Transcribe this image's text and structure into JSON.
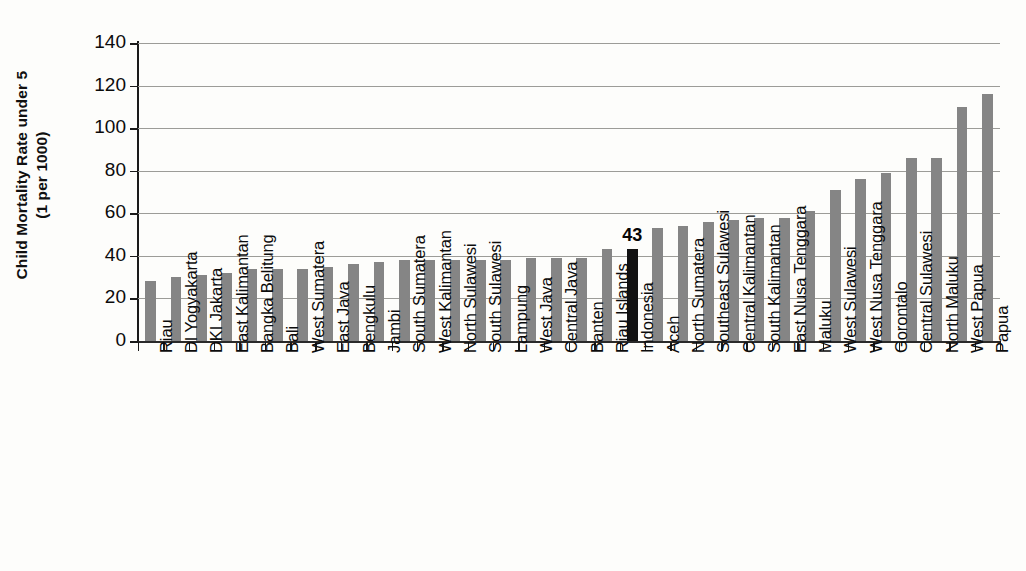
{
  "chart_data": {
    "type": "bar",
    "title": "",
    "xlabel": "",
    "ylabel": "Child Mortality Rate under 5 (1 per 1000)",
    "ylabel_line1": "Child Mortality Rate under 5",
    "ylabel_line2": "(1 per 1000)",
    "ylim": [
      0,
      140
    ],
    "ytick_step": 20,
    "yticks": [
      0,
      20,
      40,
      60,
      80,
      100,
      120,
      140
    ],
    "ytick_labels": [
      "0",
      "20",
      "40",
      "60",
      "80",
      "100",
      "120",
      "140"
    ],
    "grid": true,
    "legend": "none",
    "bar_color": "#858585",
    "highlight_color": "#121212",
    "highlight_category": "Indonesia",
    "categories": [
      "Riau",
      "DI Yogyakarta",
      "DKI Jakarta",
      "East Kalimantan",
      "Bangka Belitung",
      "Bali",
      "West Sumatera",
      "East Java",
      "Bengkulu",
      "Jambi",
      "South Sumatera",
      "West Kalimantan",
      "North Sulawesi",
      "South Sulawesi",
      "Lampung",
      "West Java",
      "Central Java",
      "Banten",
      "Riau Islands",
      "Indonesia",
      "Aceh",
      "North Sumatera",
      "Southeast Sulawesi",
      "Central Kalimantan",
      "South Kalimantan",
      "East Nusa Tenggara",
      "Maluku",
      "West Sulawesi",
      "West Nusa Tenggara",
      "Gorontalo",
      "Central Sulawesi",
      "North Maluku",
      "West Papua",
      "Papua"
    ],
    "values": [
      28,
      30,
      31,
      32,
      34,
      34,
      34,
      35,
      36,
      37,
      38,
      38,
      38,
      38,
      38,
      39,
      39,
      39,
      43,
      43,
      53,
      54,
      56,
      57,
      58,
      58,
      61,
      71,
      76,
      79,
      86,
      86,
      110,
      116
    ],
    "data_labels": {
      "Indonesia": "43"
    }
  }
}
